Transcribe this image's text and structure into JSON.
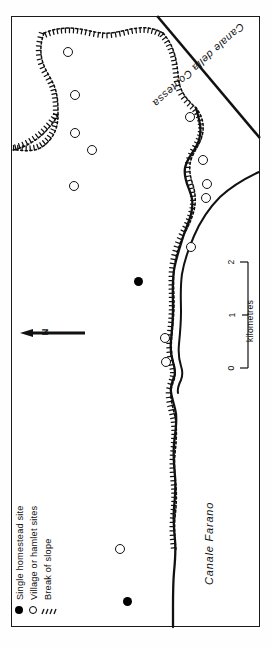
{
  "map": {
    "title": "Archaeological site distribution map",
    "orientation_note": "Map rotated 90 degrees (north to the left)",
    "frame": {
      "x": 11,
      "y": 16,
      "width": 249,
      "height": 611
    },
    "background_color": "#ffffff",
    "line_color": "#111111"
  },
  "labels": {
    "canal_contessa": "Canale della Contessa",
    "canal_farano": "Canale Farano",
    "north": "N"
  },
  "scale_bar": {
    "unit_label": "kilometres",
    "ticks": [
      "0",
      "1",
      "2"
    ],
    "min": 0,
    "max": 2
  },
  "legend": {
    "items": [
      {
        "symbol": "filled-circle",
        "label": "Single homestead site"
      },
      {
        "symbol": "open-circle",
        "label": "Village or hamlet sites"
      },
      {
        "symbol": "hachure",
        "label": "Break of slope"
      }
    ]
  },
  "sites": {
    "village_or_hamlet": [
      {
        "id": "v1",
        "x": 68,
        "y": 52
      },
      {
        "id": "v2",
        "x": 75,
        "y": 95
      },
      {
        "id": "v3",
        "x": 75,
        "y": 133
      },
      {
        "id": "v4",
        "x": 92,
        "y": 150
      },
      {
        "id": "v5",
        "x": 74,
        "y": 186
      },
      {
        "id": "v6",
        "x": 190,
        "y": 117
      },
      {
        "id": "v7",
        "x": 203,
        "y": 160
      },
      {
        "id": "v8",
        "x": 207,
        "y": 184
      },
      {
        "id": "v9",
        "x": 206,
        "y": 198
      },
      {
        "id": "v10",
        "x": 191,
        "y": 247
      },
      {
        "id": "v11",
        "x": 165,
        "y": 338
      },
      {
        "id": "v12",
        "x": 166,
        "y": 362
      },
      {
        "id": "v13",
        "x": 120,
        "y": 549
      }
    ],
    "single_homestead": [
      {
        "id": "h1",
        "x": 138,
        "y": 281
      },
      {
        "id": "h2",
        "x": 127,
        "y": 601
      }
    ]
  },
  "features": {
    "break_of_slope_description": "Hachured / dotted line marking break of slope",
    "canal_contessa_description": "Straight diagonal channel line in upper right",
    "canal_farano_description": "Meandering double-line watercourse running down the right side"
  },
  "counts": {
    "village_or_hamlet_sites": 13,
    "single_homestead_sites": 2
  }
}
